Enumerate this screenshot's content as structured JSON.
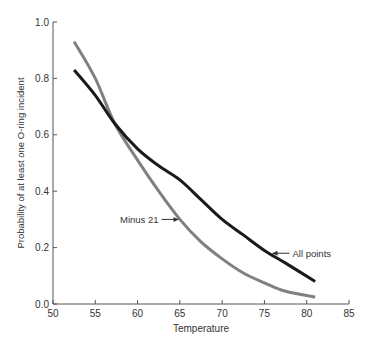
{
  "chart_data": {
    "type": "line",
    "title": "",
    "xlabel": "Temperature",
    "ylabel": "Probability of at least one O-ring incident",
    "xlim": [
      50,
      85
    ],
    "ylim": [
      0.0,
      1.0
    ],
    "xticks": [
      50,
      55,
      60,
      65,
      70,
      75,
      80,
      85
    ],
    "yticks": [
      0.0,
      0.2,
      0.4,
      0.6,
      0.8,
      1.0
    ],
    "ytick_labels": [
      "0.0",
      "0.2",
      "0.4",
      "0.6",
      "0.8",
      "1.0"
    ],
    "grid": false,
    "legend": "none (inline annotations)",
    "series": [
      {
        "name": "All points",
        "color": "#1a1a1a",
        "x": [
          52.5,
          55,
          57.3,
          60,
          62.5,
          65,
          67.5,
          70,
          72.5,
          75,
          77.5,
          81
        ],
        "y": [
          0.83,
          0.74,
          0.64,
          0.55,
          0.49,
          0.44,
          0.37,
          0.3,
          0.245,
          0.19,
          0.145,
          0.08
        ]
      },
      {
        "name": "Minus 21",
        "color": "#808080",
        "x": [
          52.5,
          55,
          57.3,
          60,
          62.5,
          65,
          67.5,
          70,
          72.5,
          75,
          77.5,
          81
        ],
        "y": [
          0.93,
          0.8,
          0.64,
          0.51,
          0.4,
          0.3,
          0.22,
          0.16,
          0.11,
          0.075,
          0.045,
          0.025
        ]
      }
    ],
    "annotations": [
      {
        "text": "Minus 21",
        "arrow_to": [
          65.2,
          0.3
        ],
        "label_side": "left"
      },
      {
        "text": "All points",
        "arrow_to": [
          75.6,
          0.18
        ],
        "label_side": "right"
      }
    ]
  }
}
